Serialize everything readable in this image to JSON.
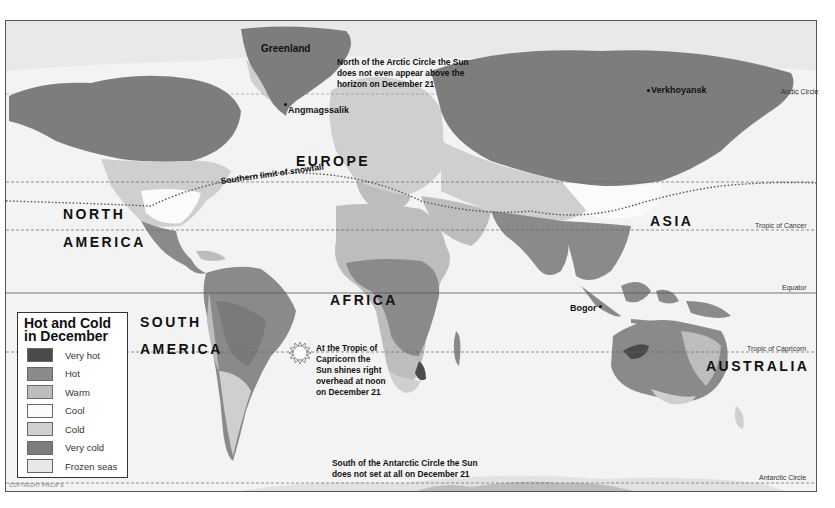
{
  "map": {
    "title": "Hot and Cold in December",
    "copyright": "COPYRIGHT PHILIP'S",
    "regions": {
      "north_america_1": "NORTH",
      "north_america_2": "AMERICA",
      "south_america_1": "SOUTH",
      "south_america_2": "AMERICA",
      "europe": "EUROPE",
      "africa": "AFRICA",
      "asia": "ASIA",
      "australia": "AUSTRALIA"
    },
    "places": {
      "greenland": "Greenland",
      "angmagssalik": "Angmagssalik",
      "verkhoyansk": "Verkhoyansk",
      "bogor": "Bogor"
    },
    "lines": {
      "arctic_circle": "Arctic Circle",
      "tropic_cancer": "Tropic of Cancer",
      "equator": "Equator",
      "tropic_capricorn": "Tropic of Capricorn",
      "antarctic_circle": "Antarctic Circle",
      "snowfall": "Southern limit of snowfall"
    },
    "notes": {
      "arctic": [
        "North of the Arctic Circle the Sun",
        "does not even appear above the",
        "horizon on December 21"
      ],
      "capricorn": [
        "At the Tropic of",
        "Capricorn the",
        "Sun shines right",
        "overhead at noon",
        "on December 21"
      ],
      "antarctic": [
        "South of the Antarctic Circle the Sun",
        "does not set at all on December 21"
      ]
    }
  },
  "legend": {
    "title_line1": "Hot and Cold",
    "title_line2": "in December",
    "items": [
      {
        "label": "Very hot",
        "color": "#4a4a4a"
      },
      {
        "label": "Hot",
        "color": "#8a8a8a"
      },
      {
        "label": "Warm",
        "color": "#bdbdbd"
      },
      {
        "label": "Cool",
        "color": "#fbfbfb"
      },
      {
        "label": "Cold",
        "color": "#cfcfcf"
      },
      {
        "label": "Very cold",
        "color": "#7d7d7d"
      },
      {
        "label": "Frozen seas",
        "color": "#e8e8e8"
      }
    ]
  }
}
